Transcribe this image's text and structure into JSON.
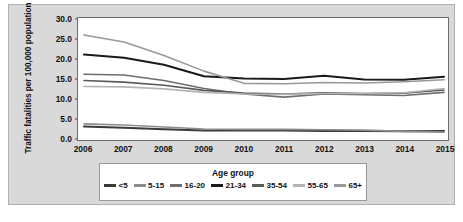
{
  "chart_data": {
    "type": "line",
    "title": "",
    "xlabel": "",
    "ylabel": "Traffic fatalities per 100,000 population",
    "legend_title": "Age group",
    "legend_position": "bottom",
    "grid": false,
    "x": [
      2006,
      2007,
      2008,
      2009,
      2010,
      2011,
      2012,
      2013,
      2014,
      2015
    ],
    "xticklabels": [
      "2006",
      "2007",
      "2008",
      "2009",
      "2010",
      "2011",
      "2012",
      "2013",
      "2014",
      "2015"
    ],
    "yticklabels": [
      "0.0",
      "5.0",
      "10.0",
      "15.0",
      "20.0",
      "25.0",
      "30.0"
    ],
    "ytickvalues": [
      0.0,
      5.0,
      10.0,
      15.0,
      20.0,
      25.0,
      30.0
    ],
    "ylim": [
      0.0,
      30.0
    ],
    "xlim": [
      2006,
      2015
    ],
    "series": [
      {
        "name": "<5",
        "color": "#3a3a3a",
        "values": [
          2.9,
          2.6,
          2.2,
          1.9,
          1.9,
          1.9,
          1.8,
          1.8,
          1.7,
          1.8
        ]
      },
      {
        "name": "5-15",
        "color": "#8c8c8c",
        "values": [
          3.6,
          3.3,
          2.8,
          2.3,
          2.2,
          2.2,
          2.1,
          2.0,
          1.7,
          1.5
        ]
      },
      {
        "name": "16-20",
        "color": "#6e6e6e",
        "values": [
          16.2,
          16.0,
          14.6,
          12.6,
          11.2,
          10.4,
          11.2,
          11.0,
          10.8,
          11.6
        ]
      },
      {
        "name": "21-34",
        "color": "#1a1a1a",
        "values": [
          21.2,
          20.4,
          18.6,
          15.7,
          15.1,
          15.0,
          15.8,
          14.9,
          14.8,
          15.6
        ]
      },
      {
        "name": "35-54",
        "color": "#5a5a5a",
        "values": [
          14.6,
          14.2,
          13.4,
          12.1,
          11.4,
          11.2,
          11.5,
          11.3,
          11.4,
          12.2
        ]
      },
      {
        "name": "55-65",
        "color": "#b4b4b4",
        "values": [
          13.1,
          13.0,
          12.5,
          11.6,
          11.2,
          11.1,
          11.3,
          11.3,
          11.5,
          12.6
        ]
      },
      {
        "name": "65+",
        "color": "#999999",
        "values": [
          26.2,
          24.4,
          21.0,
          17.0,
          13.9,
          13.8,
          14.1,
          14.0,
          14.3,
          14.8
        ]
      }
    ]
  },
  "colors": {
    "figure_background": "#d9d9d9",
    "plot_background": "#ffffff",
    "axis": "#6d6d6d",
    "text": "#111111"
  }
}
